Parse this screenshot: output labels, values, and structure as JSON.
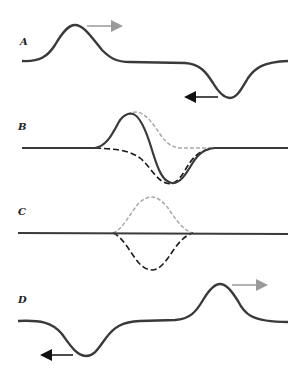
{
  "panels": [
    {
      "id": "A",
      "label": "A"
    },
    {
      "id": "B",
      "label": "B"
    },
    {
      "id": "C",
      "label": "C"
    },
    {
      "id": "D",
      "label": "D"
    }
  ],
  "colors": {
    "solid": "#3a3a3a",
    "gray_dashed": "#a8a8a8",
    "black_dashed": "#1a1a1a",
    "gray_arrow": "#9a9a9a",
    "black_arrow": "#111111"
  }
}
